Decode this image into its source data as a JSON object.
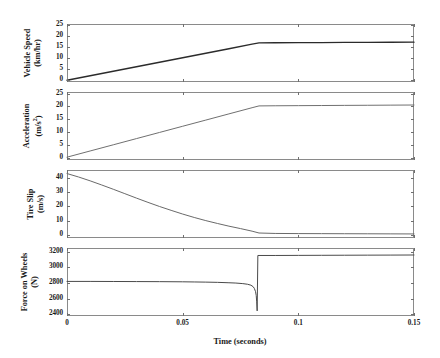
{
  "figure": {
    "xlabel": "Time (seconds)",
    "x_ticks": [
      "0",
      "0.05",
      "0.1",
      "0.15"
    ],
    "x_tick_values": [
      0,
      0.05,
      0.1,
      0.15
    ],
    "xlim": [
      0,
      0.15
    ],
    "grid": false,
    "background": "#ffffff",
    "axis_color": "#8a8a8a",
    "line_color": "#2b2b2b"
  },
  "panels": [
    {
      "name": "vehicle-speed",
      "ylabel_line1": "Vehicle Speed",
      "ylabel_line2": "(km/hr)",
      "y_ticks": [
        "0",
        "5",
        "10",
        "15",
        "20",
        "25"
      ],
      "y_tick_values": [
        0,
        5,
        10,
        15,
        20,
        25
      ],
      "ylim": [
        -0.8,
        25.6
      ]
    },
    {
      "name": "acceleration",
      "ylabel_line1": "Acceleration",
      "ylabel_line2": "(m/s",
      "ylabel_sup": "2",
      "ylabel_line2_end": ")",
      "y_ticks": [
        "0",
        "5",
        "10",
        "15",
        "20",
        "25"
      ],
      "y_tick_values": [
        0,
        5,
        10,
        15,
        20,
        25
      ],
      "ylim": [
        -0.8,
        25.6
      ]
    },
    {
      "name": "tire-slip",
      "ylabel_line1": "Tire Slip",
      "ylabel_line2": "(m/s)",
      "y_ticks": [
        "0",
        "10",
        "20",
        "30",
        "40"
      ],
      "y_tick_values": [
        0,
        10,
        20,
        30,
        40
      ],
      "ylim": [
        -2.2,
        45.5
      ]
    },
    {
      "name": "force-on-wheels",
      "ylabel_line1": "Force on Wheels",
      "ylabel_line2": "(N)",
      "y_ticks": [
        "2400",
        "2600",
        "2800",
        "3000",
        "3200"
      ],
      "y_tick_values": [
        2400,
        2600,
        2800,
        3000,
        3200
      ],
      "ylim": [
        2380,
        3245
      ]
    }
  ],
  "chart_data": [
    {
      "type": "line",
      "title": "",
      "xlabel": "Time (seconds)",
      "ylabel": "Vehicle Speed (km/hr)",
      "xlim": [
        0,
        0.15
      ],
      "ylim": [
        -0.8,
        25.6
      ],
      "grid": false,
      "series": [
        {
          "name": "Vehicle Speed",
          "x": [
            0,
            0.01,
            0.02,
            0.03,
            0.04,
            0.05,
            0.06,
            0.07,
            0.08,
            0.083,
            0.09,
            0.1,
            0.11,
            0.12,
            0.13,
            0.14,
            0.15
          ],
          "values": [
            0.0,
            2.05,
            4.1,
            6.15,
            8.2,
            10.25,
            12.3,
            14.35,
            16.4,
            17.0,
            17.05,
            17.1,
            17.15,
            17.2,
            17.25,
            17.3,
            17.35
          ]
        }
      ]
    },
    {
      "type": "line",
      "title": "",
      "xlabel": "Time (seconds)",
      "ylabel": "Acceleration (m/s^2)",
      "xlim": [
        0,
        0.15
      ],
      "ylim": [
        -0.8,
        25.6
      ],
      "grid": false,
      "series": [
        {
          "name": "Acceleration",
          "x": [
            0,
            0.01,
            0.02,
            0.03,
            0.04,
            0.05,
            0.06,
            0.07,
            0.08,
            0.083,
            0.09,
            0.1,
            0.11,
            0.12,
            0.13,
            0.14,
            0.15
          ],
          "values": [
            0.3,
            2.7,
            5.1,
            7.5,
            9.9,
            12.3,
            14.7,
            17.1,
            19.5,
            20.2,
            20.25,
            20.3,
            20.35,
            20.4,
            20.45,
            20.5,
            20.55
          ]
        }
      ]
    },
    {
      "type": "line",
      "title": "",
      "xlabel": "Time (seconds)",
      "ylabel": "Tire Slip (m/s)",
      "xlim": [
        0,
        0.15
      ],
      "ylim": [
        -2.2,
        45.5
      ],
      "grid": false,
      "series": [
        {
          "name": "Tire Slip",
          "x": [
            0,
            0.005,
            0.01,
            0.015,
            0.02,
            0.025,
            0.03,
            0.035,
            0.04,
            0.045,
            0.05,
            0.055,
            0.06,
            0.065,
            0.07,
            0.075,
            0.08,
            0.083,
            0.09,
            0.1,
            0.11,
            0.12,
            0.13,
            0.14,
            0.15
          ],
          "values": [
            43.0,
            40.6,
            37.9,
            35.0,
            32.0,
            28.9,
            25.8,
            22.8,
            19.9,
            17.2,
            14.6,
            12.2,
            10.0,
            8.0,
            6.1,
            4.4,
            2.6,
            1.3,
            1.0,
            0.9,
            0.85,
            0.8,
            0.75,
            0.7,
            0.65
          ]
        }
      ]
    },
    {
      "type": "line",
      "title": "",
      "xlabel": "Time (seconds)",
      "ylabel": "Force on Wheels (N)",
      "xlim": [
        0,
        0.15
      ],
      "ylim": [
        2380,
        3245
      ],
      "grid": false,
      "series": [
        {
          "name": "Force on Wheels",
          "x": [
            0,
            0.01,
            0.02,
            0.03,
            0.04,
            0.05,
            0.055,
            0.06,
            0.065,
            0.07,
            0.073,
            0.076,
            0.078,
            0.0795,
            0.0805,
            0.081,
            0.0815,
            0.0818,
            0.082,
            0.0822,
            0.0825,
            0.09,
            0.1,
            0.11,
            0.12,
            0.13,
            0.14,
            0.15
          ],
          "values": [
            2820,
            2820,
            2819,
            2818,
            2817,
            2815,
            2813,
            2811,
            2808,
            2803,
            2799,
            2792,
            2784,
            2772,
            2752,
            2730,
            2690,
            2640,
            2560,
            2445,
            3150,
            3150,
            3151,
            3152,
            3153,
            3154,
            3155,
            3156
          ]
        }
      ]
    }
  ]
}
